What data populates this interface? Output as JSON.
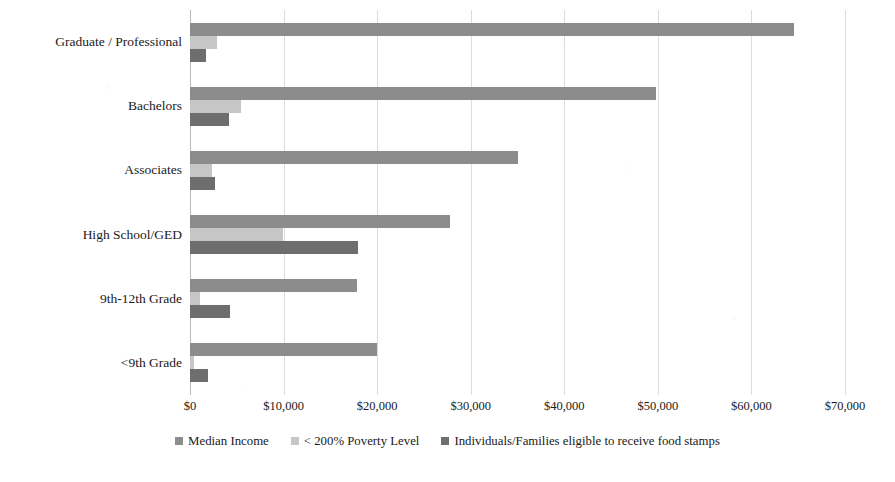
{
  "chart_data": {
    "type": "bar",
    "orientation": "horizontal",
    "title": "",
    "xlabel": "",
    "ylabel": "",
    "xlim": [
      0,
      70000
    ],
    "xticks": [
      "$0",
      "$10,000",
      "$20,000",
      "$30,000",
      "$40,000",
      "$50,000",
      "$60,000",
      "$70,000"
    ],
    "xtick_values": [
      0,
      10000,
      20000,
      30000,
      40000,
      50000,
      60000,
      70000
    ],
    "grid": true,
    "legend_position": "bottom",
    "categories": [
      "Graduate / Professional",
      "Bachelors",
      "Associates",
      "High School/GED",
      "9th-12th Grade",
      "<9th Grade"
    ],
    "series": [
      {
        "name": "Median Income",
        "color": "#8c8c8c",
        "values": [
          64500,
          49800,
          35000,
          27800,
          17800,
          20000
        ]
      },
      {
        "name": "< 200% Poverty Level",
        "color": "#c6c6c6",
        "values": [
          2900,
          5500,
          2400,
          9900,
          1100,
          400
        ]
      },
      {
        "name": "Individuals/Families eligible to receive food stamps",
        "color": "#6e6e6e",
        "values": [
          1700,
          4200,
          2700,
          18000,
          4300,
          1900
        ]
      }
    ]
  },
  "legend": {
    "items": [
      {
        "label": "Median Income",
        "swatch": "legend-swatch-median-income"
      },
      {
        "label": "< 200% Poverty Level",
        "swatch": "legend-swatch-poverty-level"
      },
      {
        "label": "Individuals/Families eligible to receive food stamps",
        "swatch": "legend-swatch-food-stamps"
      }
    ]
  },
  "colors": {
    "series_median_income": "#8c8c8c",
    "series_poverty_level": "#c6c6c6",
    "series_food_stamps": "#6e6e6e",
    "gridline": "#dcdcdc",
    "axis": "#b9b9b9",
    "text": "#1a1a1a",
    "background": "#ffffff"
  }
}
